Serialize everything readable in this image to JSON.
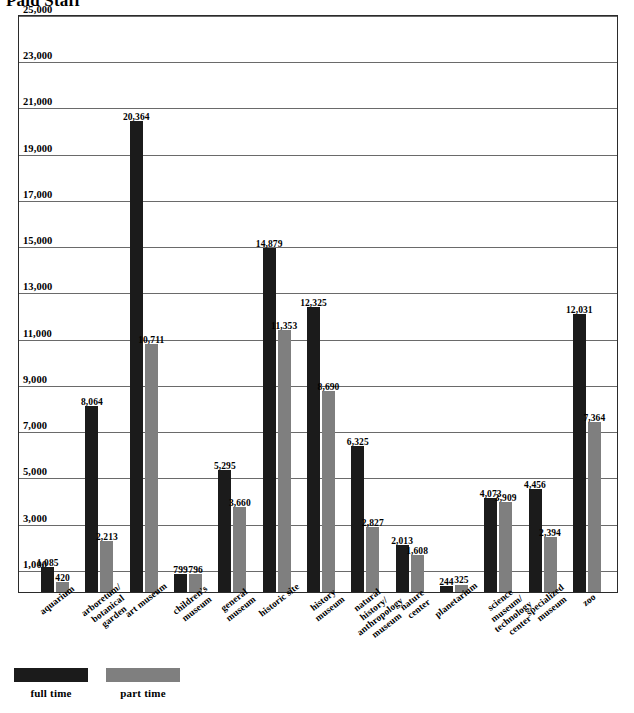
{
  "chart_title": "Paid Staff",
  "legend": {
    "position": "bottom-left",
    "entries": [
      {
        "label": "full time",
        "color": "#1b1b1b",
        "key": "full"
      },
      {
        "label": "part time",
        "color": "#7f7f7f",
        "key": "part"
      }
    ]
  },
  "chart_data": {
    "type": "bar",
    "title": "Paid Staff",
    "xlabel": "",
    "ylabel": "",
    "ylim": [
      0,
      25000
    ],
    "grid": true,
    "legend_position": "bottom-left",
    "ytick_labels": [
      "1,000",
      "3,000",
      "5,000",
      "7,000",
      "9,000",
      "11,000",
      "13,000",
      "15,000",
      "17,000",
      "19,000",
      "21,000",
      "23,000",
      "25,000"
    ],
    "yticks": [
      1000,
      3000,
      5000,
      7000,
      9000,
      11000,
      13000,
      15000,
      17000,
      19000,
      21000,
      23000,
      25000
    ],
    "categories": [
      "aquarium",
      "arboretum/\nbotanical garden",
      "art museum",
      "children's\nmuseum",
      "general\nmuseum",
      "historic site",
      "history museum",
      "natural history/\nanthropology museum",
      "nature\ncenter",
      "planetarium",
      "science museum/\ntechnology center",
      "specialized\nmuseum",
      "zoo"
    ],
    "series": [
      {
        "name": "full time",
        "color": "#1b1b1b",
        "values": [
          1085,
          8064,
          20364,
          799,
          5295,
          14879,
          12325,
          6325,
          2013,
          244,
          4073,
          4456,
          12031
        ],
        "labels": [
          "1,085",
          "8,064",
          "20,364",
          "799",
          "5,295",
          "14,879",
          "12,325",
          "6,325",
          "2,013",
          "244",
          "4,073",
          "4,456",
          "12,031"
        ]
      },
      {
        "name": "part time",
        "color": "#7f7f7f",
        "values": [
          420,
          2213,
          10711,
          796,
          3660,
          11353,
          8690,
          2827,
          1608,
          325,
          3909,
          2394,
          7364
        ],
        "labels": [
          "420",
          "2,213",
          "10,711",
          "796",
          "3,660",
          "11,353",
          "8,690",
          "2,827",
          "1,608",
          "325",
          "3,909",
          "2,394",
          "7,364"
        ]
      }
    ]
  }
}
